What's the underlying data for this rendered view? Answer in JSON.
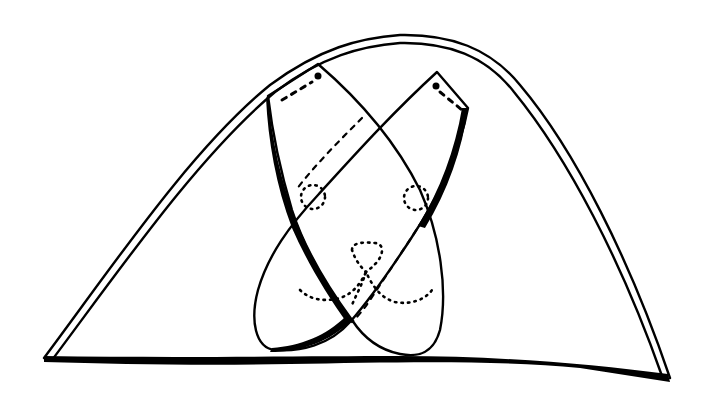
{
  "diagram": {
    "subject": "folded paper dog face",
    "colors": {
      "ink": "#000000",
      "paper": "#ffffff"
    },
    "elements": [
      "outer-triangle-double-edge",
      "left-ear-flap",
      "right-ear-flap",
      "fold-line-dashed",
      "left-eye-dotted",
      "right-eye-dotted",
      "nose-dotted",
      "mouth-dotted"
    ]
  }
}
